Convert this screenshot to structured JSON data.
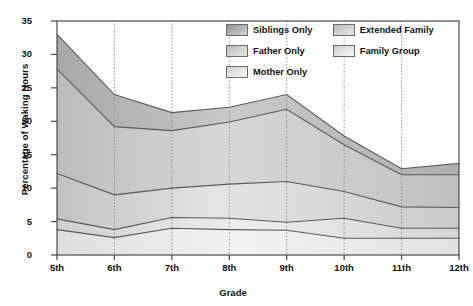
{
  "chart_data": {
    "type": "area",
    "title": "",
    "subtitle": "",
    "xlabel": "Grade",
    "ylabel": "Percentage of Waking Hours",
    "categories": [
      "5th",
      "6th",
      "7th",
      "8th",
      "9th",
      "10th",
      "11th",
      "12th"
    ],
    "x": [
      5,
      6,
      7,
      8,
      9,
      10,
      11,
      12
    ],
    "ylim": [
      0,
      35
    ],
    "yticks": [
      0,
      5,
      10,
      15,
      20,
      25,
      30,
      35
    ],
    "grid": "vertical-dotted",
    "stacked": true,
    "legend_position": "top-right-inside",
    "series": [
      {
        "name": "Mother Only",
        "color": "#e8e8e8",
        "values": [
          3.8,
          2.6,
          4.0,
          3.8,
          3.7,
          2.5,
          2.5,
          2.5
        ],
        "cumulative": [
          3.8,
          2.6,
          4.0,
          3.8,
          3.7,
          2.5,
          2.5,
          2.5
        ]
      },
      {
        "name": "Family Group",
        "color": "#d8d8d8",
        "values": [
          1.6,
          1.2,
          1.6,
          1.7,
          1.2,
          3.0,
          1.5,
          1.5
        ],
        "cumulative": [
          5.4,
          3.8,
          5.6,
          5.5,
          4.9,
          5.5,
          4.0,
          4.0
        ]
      },
      {
        "name": "Father Only",
        "color": "#cccccc",
        "values": [
          6.8,
          5.2,
          4.4,
          5.1,
          6.1,
          4.0,
          3.2,
          3.1
        ],
        "cumulative": [
          12.2,
          9.0,
          10.0,
          10.6,
          11.0,
          9.5,
          7.2,
          7.1
        ]
      },
      {
        "name": "Extended Family",
        "color": "#c4c4c4",
        "values": [
          15.6,
          10.2,
          8.6,
          9.3,
          10.8,
          7.0,
          4.8,
          4.9
        ],
        "cumulative": [
          27.8,
          19.2,
          18.6,
          19.9,
          21.8,
          16.5,
          12.0,
          12.0
        ]
      },
      {
        "name": "Siblings Only",
        "color": "#b0b0b0",
        "values": [
          5.2,
          4.8,
          2.7,
          2.2,
          2.2,
          1.3,
          0.9,
          1.7
        ],
        "cumulative": [
          33.0,
          24.0,
          21.3,
          22.1,
          24.0,
          17.8,
          12.9,
          13.7
        ]
      }
    ],
    "legend_entries": [
      {
        "label": "Siblings Only",
        "color": "#b0b0b0"
      },
      {
        "label": "Father Only",
        "color": "#cccccc"
      },
      {
        "label": "Mother Only",
        "color": "#e8e8e8"
      },
      {
        "label": "Extended Family",
        "color": "#c4c4c4"
      },
      {
        "label": "Family Group",
        "color": "#d8d8d8"
      }
    ]
  },
  "axis": {
    "y_label": "Percentage of Waking Hours",
    "x_label": "Grade",
    "y_ticks": [
      "35",
      "30",
      "25",
      "20",
      "15",
      "10",
      "5",
      "0"
    ],
    "x_ticks": [
      "5th",
      "6th",
      "7th",
      "8th",
      "9th",
      "10th",
      "11th",
      "12th"
    ]
  },
  "legend": {
    "items": [
      {
        "label": "Siblings Only"
      },
      {
        "label": "Father Only"
      },
      {
        "label": "Mother Only"
      },
      {
        "label": "Extended Family"
      },
      {
        "label": "Family Group"
      }
    ]
  },
  "colors": {
    "frame": "#4a4a4a",
    "gridline": "#8a8a8a",
    "outline": "#5a5a5a",
    "text": "#111111",
    "background": "#ffffff"
  }
}
